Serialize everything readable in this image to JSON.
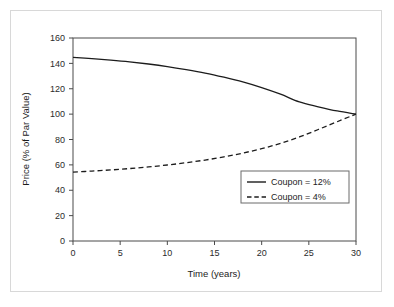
{
  "chart_data": {
    "type": "line",
    "title": "",
    "xlabel": "Time (years)",
    "ylabel": "Price (% of Par Value)",
    "xlim": [
      0,
      30
    ],
    "ylim": [
      0,
      160
    ],
    "xticks": [
      "0",
      "5",
      "10",
      "15",
      "20",
      "25",
      "30"
    ],
    "xtick_values": [
      0,
      5,
      10,
      15,
      20,
      25,
      30
    ],
    "yticks": [
      "0",
      "20",
      "40",
      "60",
      "80",
      "100",
      "120",
      "140",
      "160"
    ],
    "ytick_values": [
      0,
      20,
      40,
      60,
      80,
      100,
      120,
      140,
      160
    ],
    "grid": false,
    "legend_position": "lower-right",
    "x": [
      0,
      2,
      4,
      6,
      8,
      10,
      12,
      14,
      16,
      18,
      20,
      22,
      24,
      26,
      28,
      30
    ],
    "series": [
      {
        "name": "Coupon = 12%",
        "style": "solid",
        "color": "#1c1c1c",
        "values": [
          144.8,
          143.8,
          142.6,
          141.2,
          139.5,
          137.5,
          135.1,
          132.4,
          129.1,
          125.4,
          120.9,
          115.7,
          109.6,
          105.8,
          102.5,
          100.0
        ]
      },
      {
        "name": "Coupon = 4%",
        "style": "dashed",
        "color": "#1c1c1c",
        "values": [
          54.3,
          55.1,
          56.0,
          57.1,
          58.4,
          59.9,
          61.7,
          63.8,
          66.3,
          69.3,
          72.8,
          77.0,
          82.0,
          87.9,
          94.0,
          100.0
        ]
      }
    ]
  },
  "legend": {
    "items": [
      {
        "label": "Coupon = 12%",
        "style": "solid"
      },
      {
        "label": "Coupon = 4%",
        "style": "dashed"
      }
    ]
  }
}
